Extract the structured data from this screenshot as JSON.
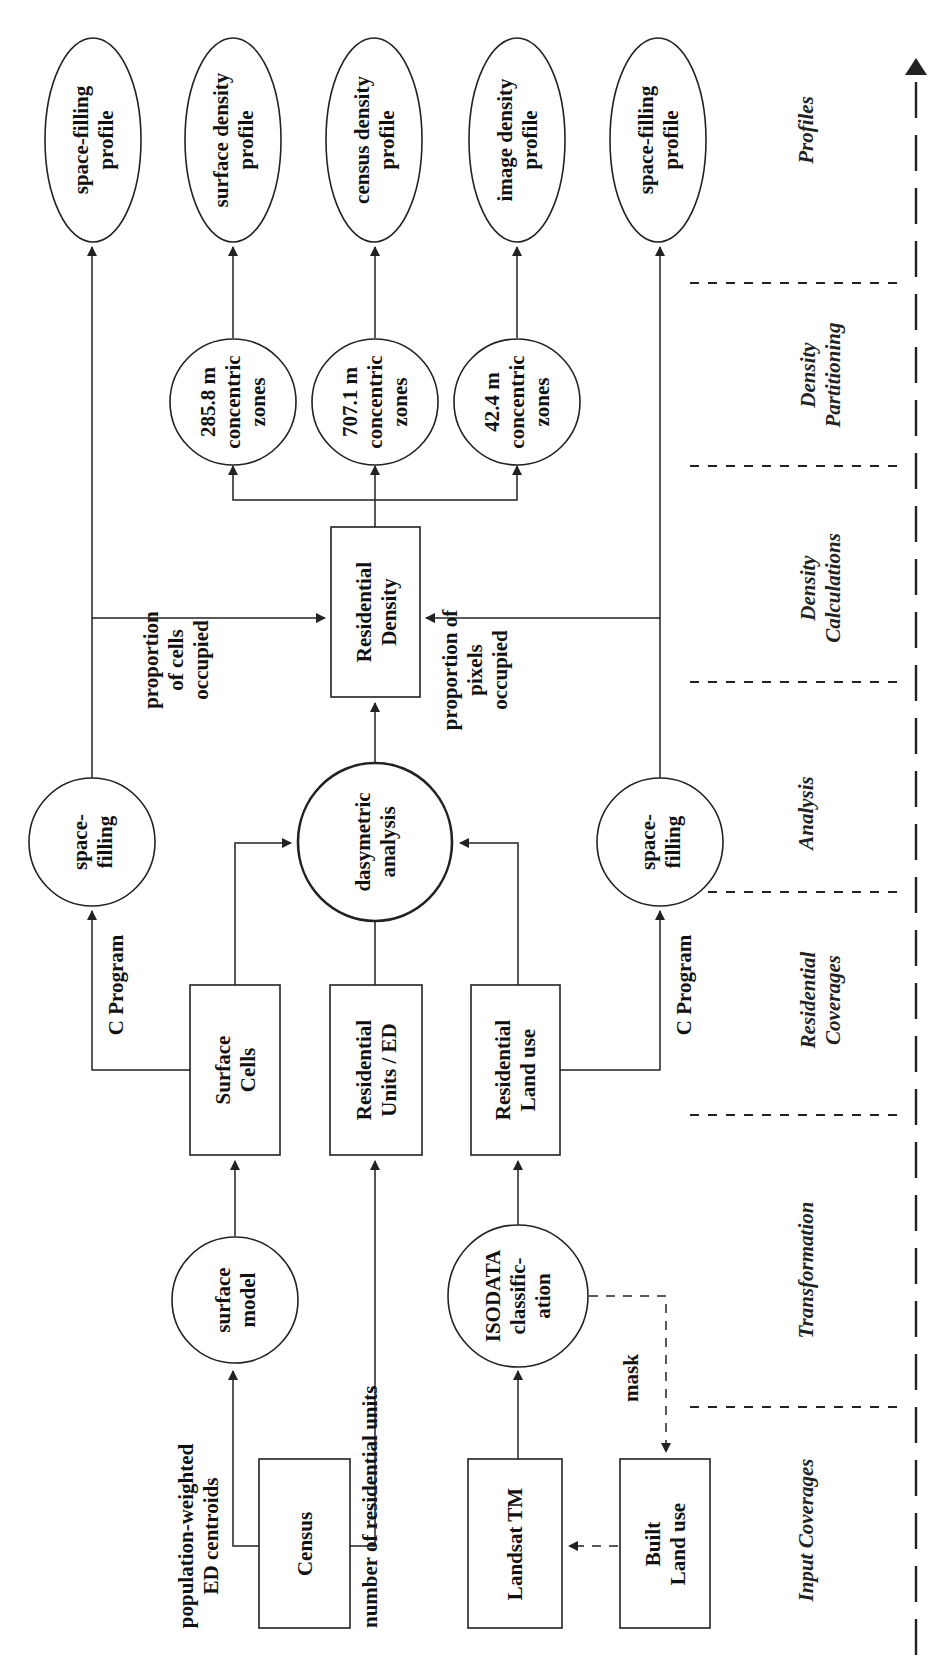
{
  "diagram": {
    "orientation": "rotated-90-ccw",
    "stages": [
      {
        "id": "input",
        "label": [
          "Input Coverages"
        ]
      },
      {
        "id": "transformation",
        "label": [
          "Transformation"
        ]
      },
      {
        "id": "residential",
        "label": [
          "Residential",
          "Coverages"
        ]
      },
      {
        "id": "analysis",
        "label": [
          "Analysis"
        ]
      },
      {
        "id": "calc",
        "label": [
          "Density",
          "Calculations"
        ]
      },
      {
        "id": "partition",
        "label": [
          "Density",
          "Partitioning"
        ]
      },
      {
        "id": "profiles",
        "label": [
          "Profiles"
        ]
      }
    ],
    "nodes": {
      "census": {
        "shape": "box",
        "label": [
          "Census"
        ]
      },
      "landsat": {
        "shape": "box",
        "label": [
          "Landsat TM"
        ]
      },
      "built_land_use": {
        "shape": "box",
        "label": [
          "Built",
          "Land use"
        ]
      },
      "surface_model": {
        "shape": "circle",
        "label": [
          "surface",
          "model"
        ]
      },
      "isodata": {
        "shape": "circle",
        "label": [
          "ISODATA",
          "classific-",
          "ation"
        ]
      },
      "surface_cells": {
        "shape": "box",
        "label": [
          "Surface",
          "Cells"
        ]
      },
      "residential_units": {
        "shape": "box",
        "label": [
          "Residential",
          "Units / ED"
        ]
      },
      "residential_land_use": {
        "shape": "box",
        "label": [
          "Residential",
          "Land use"
        ]
      },
      "space_filling_a": {
        "shape": "circle",
        "label": [
          "space-",
          "filling"
        ]
      },
      "dasymetric": {
        "shape": "circle",
        "label": [
          "dasymetric",
          "analysis"
        ]
      },
      "space_filling_b": {
        "shape": "circle",
        "label": [
          "space-",
          "filling"
        ]
      },
      "residential_density": {
        "shape": "box",
        "label": [
          "Residential",
          "Density"
        ]
      },
      "zones_285": {
        "shape": "circle",
        "label": [
          "285.8 m",
          "concentric",
          "zones"
        ]
      },
      "zones_707": {
        "shape": "circle",
        "label": [
          "707.1 m",
          "concentric",
          "zones"
        ]
      },
      "zones_42": {
        "shape": "circle",
        "label": [
          "42.4 m",
          "concentric",
          "zones"
        ]
      },
      "profile_space_a": {
        "shape": "ellipse",
        "label": [
          "space-filling",
          "profile"
        ]
      },
      "profile_surface": {
        "shape": "ellipse",
        "label": [
          "surface density",
          "profile"
        ]
      },
      "profile_census": {
        "shape": "ellipse",
        "label": [
          "census density",
          "profile"
        ]
      },
      "profile_image": {
        "shape": "ellipse",
        "label": [
          "image density",
          "profile"
        ]
      },
      "profile_space_b": {
        "shape": "ellipse",
        "label": [
          "space-filling",
          "profile"
        ]
      }
    },
    "edge_labels": {
      "centroids": [
        "population-weighted",
        "ED centroids"
      ],
      "res_units": [
        "number of  residential units"
      ],
      "mask": [
        "mask"
      ],
      "c_program_a": [
        "C Program"
      ],
      "c_program_b": [
        "C Program"
      ],
      "cells_occupied": [
        "proportion",
        "of cells",
        "occupied"
      ],
      "pixels_occupied": [
        "proportion of",
        "pixels",
        "occupied"
      ]
    },
    "edges": [
      {
        "from": "census",
        "to": "surface_model",
        "label": "centroids"
      },
      {
        "from": "census",
        "to": "residential_units",
        "label": "res_units"
      },
      {
        "from": "landsat",
        "to": "isodata"
      },
      {
        "from": "isodata",
        "to": "built_land_use",
        "style": "dashed",
        "label": "mask"
      },
      {
        "from": "built_land_use",
        "to": "landsat",
        "style": "dashed"
      },
      {
        "from": "surface_model",
        "to": "surface_cells"
      },
      {
        "from": "isodata",
        "to": "residential_land_use"
      },
      {
        "from": "surface_cells",
        "to": "space_filling_a",
        "label": "c_program_a"
      },
      {
        "from": "surface_cells",
        "to": "dasymetric"
      },
      {
        "from": "residential_units",
        "to": "dasymetric"
      },
      {
        "from": "residential_land_use",
        "to": "dasymetric"
      },
      {
        "from": "residential_land_use",
        "to": "space_filling_b",
        "label": "c_program_b"
      },
      {
        "from": "dasymetric",
        "to": "residential_density"
      },
      {
        "from": "space_filling_a",
        "to": "residential_density",
        "label": "cells_occupied"
      },
      {
        "from": "space_filling_b",
        "to": "residential_density",
        "label": "pixels_occupied"
      },
      {
        "from": "space_filling_a",
        "to": "profile_space_a"
      },
      {
        "from": "space_filling_b",
        "to": "profile_space_b"
      },
      {
        "from": "residential_density",
        "to": "zones_285"
      },
      {
        "from": "residential_density",
        "to": "zones_707"
      },
      {
        "from": "residential_density",
        "to": "zones_42"
      },
      {
        "from": "zones_285",
        "to": "profile_surface"
      },
      {
        "from": "zones_707",
        "to": "profile_census"
      },
      {
        "from": "zones_42",
        "to": "profile_image"
      }
    ]
  }
}
